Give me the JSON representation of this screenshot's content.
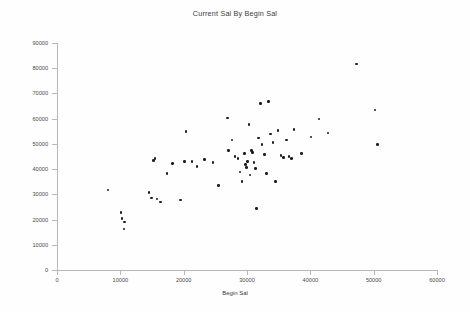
{
  "chart_data": {
    "type": "scatter",
    "title": "Current Sal By Begin Sal",
    "xlabel": "Begin Sal",
    "ylabel": "Current Sal",
    "xlim": [
      0,
      60000
    ],
    "ylim": [
      0,
      90000
    ],
    "xticks": [
      0,
      10000,
      20000,
      30000,
      40000,
      50000,
      60000
    ],
    "yticks": [
      0,
      10000,
      20000,
      30000,
      40000,
      50000,
      60000,
      70000,
      80000,
      90000
    ],
    "xtick_labels": [
      "0",
      "10000",
      "20000",
      "30000",
      "40000",
      "50000",
      "60000"
    ],
    "ytick_labels": [
      "0",
      "10000",
      "20000",
      "30000",
      "40000",
      "50000",
      "60000",
      "70000",
      "80000",
      "90000"
    ],
    "grid": false,
    "legend": false,
    "marker": "filled-circle",
    "marker_color": "#1d1d1d",
    "points": [
      {
        "x": 8050,
        "y": 31700
      },
      {
        "x": 10100,
        "y": 22900
      },
      {
        "x": 10250,
        "y": 20300
      },
      {
        "x": 10600,
        "y": 16300
      },
      {
        "x": 10700,
        "y": 19000
      },
      {
        "x": 14500,
        "y": 30800
      },
      {
        "x": 14900,
        "y": 28500
      },
      {
        "x": 15200,
        "y": 43500
      },
      {
        "x": 15500,
        "y": 44300
      },
      {
        "x": 15800,
        "y": 28100
      },
      {
        "x": 16300,
        "y": 26900
      },
      {
        "x": 17400,
        "y": 38300
      },
      {
        "x": 18200,
        "y": 42200
      },
      {
        "x": 19500,
        "y": 27700
      },
      {
        "x": 20100,
        "y": 43100
      },
      {
        "x": 20400,
        "y": 54800
      },
      {
        "x": 21300,
        "y": 43100
      },
      {
        "x": 22100,
        "y": 41000
      },
      {
        "x": 23300,
        "y": 43900
      },
      {
        "x": 24600,
        "y": 42600
      },
      {
        "x": 25500,
        "y": 33600
      },
      {
        "x": 26900,
        "y": 60200
      },
      {
        "x": 27100,
        "y": 47400
      },
      {
        "x": 27600,
        "y": 51500
      },
      {
        "x": 28100,
        "y": 45000
      },
      {
        "x": 28600,
        "y": 44300
      },
      {
        "x": 28900,
        "y": 38800
      },
      {
        "x": 29200,
        "y": 35200
      },
      {
        "x": 29600,
        "y": 46200
      },
      {
        "x": 29800,
        "y": 41800
      },
      {
        "x": 29900,
        "y": 40600
      },
      {
        "x": 30100,
        "y": 43100
      },
      {
        "x": 30300,
        "y": 57600
      },
      {
        "x": 30500,
        "y": 37600
      },
      {
        "x": 30700,
        "y": 47400
      },
      {
        "x": 30900,
        "y": 46600
      },
      {
        "x": 31100,
        "y": 42600
      },
      {
        "x": 31300,
        "y": 40200
      },
      {
        "x": 31500,
        "y": 24300
      },
      {
        "x": 31800,
        "y": 52300
      },
      {
        "x": 32100,
        "y": 66000
      },
      {
        "x": 32400,
        "y": 49800
      },
      {
        "x": 32800,
        "y": 45800
      },
      {
        "x": 33100,
        "y": 38300
      },
      {
        "x": 33400,
        "y": 66800
      },
      {
        "x": 33700,
        "y": 53900
      },
      {
        "x": 34100,
        "y": 50600
      },
      {
        "x": 34500,
        "y": 35200
      },
      {
        "x": 34900,
        "y": 55200
      },
      {
        "x": 35400,
        "y": 45400
      },
      {
        "x": 35800,
        "y": 44600
      },
      {
        "x": 36200,
        "y": 51500
      },
      {
        "x": 36600,
        "y": 45000
      },
      {
        "x": 37000,
        "y": 44300
      },
      {
        "x": 37400,
        "y": 55600
      },
      {
        "x": 38600,
        "y": 46200
      },
      {
        "x": 40100,
        "y": 52700
      },
      {
        "x": 41400,
        "y": 59800
      },
      {
        "x": 42800,
        "y": 54300
      },
      {
        "x": 47300,
        "y": 81700
      },
      {
        "x": 50200,
        "y": 63500
      },
      {
        "x": 50600,
        "y": 49800
      }
    ]
  }
}
